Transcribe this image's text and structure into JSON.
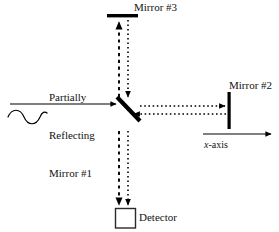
{
  "figure": {
    "background_color": "#ffffff",
    "ink_color": "#000000",
    "width": 279,
    "height": 232
  },
  "labels": {
    "mirror3": "Mirror #3",
    "mirror2": "Mirror #2",
    "beamsplitter_line1": "Partially",
    "beamsplitter_line2": "Reflecting",
    "beamsplitter_line3": "Mirror #1",
    "detector": "Detector",
    "xaxis_italic": "x",
    "xaxis_rest": "-axis",
    "source_line1": "t",
    "source_line2": "ce",
    "faint_top": "",
    "faint_mid": ""
  },
  "components": {
    "mirror3": {
      "kind": "horizontal-bar",
      "x": 107,
      "y": 14,
      "width": 31,
      "height": 3.4
    },
    "mirror2": {
      "kind": "vertical-bar",
      "x": 227.5,
      "y": 92,
      "width": 3.2,
      "height": 37
    },
    "beamsplitter": {
      "kind": "diagonal-bar",
      "x1": 117,
      "y1": 97,
      "x2": 140,
      "y2": 121,
      "thickness": 4.2
    },
    "detector": {
      "kind": "square-outline",
      "x": 115,
      "y": 208,
      "size": 20,
      "stroke": 1.4
    }
  },
  "beams": {
    "input": {
      "style": "solid",
      "direction": "right",
      "from_x": 10,
      "to_x": 117,
      "y": 104
    },
    "wave": {
      "style": "sine",
      "from_x": 8,
      "to_x": 47,
      "y": 117,
      "cycles": 2
    },
    "up_to_mirror3": {
      "style": "dashed",
      "direction": "up",
      "x": 119,
      "from_y": 97,
      "to_y": 20
    },
    "down_from_mirror3": {
      "style": "dotted",
      "direction": "down",
      "x": 128,
      "from_y": 20,
      "to_y": 99
    },
    "right_to_mirror2": {
      "style": "dotted",
      "direction": "right",
      "y": 106,
      "from_x": 140,
      "to_x": 226
    },
    "left_from_mirror2": {
      "style": "dotted",
      "direction": "left",
      "y": 114,
      "from_x": 226,
      "to_x": 133
    },
    "down_left_to_detector": {
      "style": "dashed",
      "direction": "down",
      "x": 119,
      "from_y": 131,
      "to_y": 206
    },
    "down_right_to_detector": {
      "style": "dotted",
      "direction": "down",
      "x": 128,
      "from_y": 131,
      "to_y": 206
    },
    "xaxis_arrow": {
      "style": "solid",
      "direction": "right",
      "y": 134,
      "from_x": 203,
      "to_x": 272
    }
  }
}
